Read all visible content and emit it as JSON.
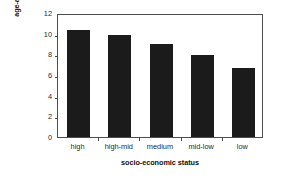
{
  "chart_data": {
    "type": "bar",
    "title": "",
    "subtitle": "",
    "xlabel": "socio-economic status",
    "ylabel": "age-adjusted incidence (per 100,000)",
    "ylabel_lines": [
      "age-adjusted incidence",
      "(per 100,000)"
    ],
    "categories": [
      "high",
      "high-mid",
      "medium",
      "mid-low",
      "low"
    ],
    "values": [
      10.4,
      9.9,
      9.0,
      7.9,
      6.7
    ],
    "series": [
      {
        "name": "age-adjusted incidence",
        "values": [
          10.4,
          9.9,
          9.0,
          7.9,
          6.7
        ]
      }
    ],
    "ylim": [
      0,
      12
    ],
    "yticks": [
      0,
      2,
      4,
      6,
      8,
      10,
      12
    ],
    "ytick_labels": [
      "0",
      "2",
      "4",
      "6",
      "8",
      "10",
      "12"
    ],
    "xlim": [
      0,
      5
    ],
    "grid": false,
    "legend": false,
    "legend_position": "none",
    "annotations": [],
    "colors": {
      "bar": "#1b1b1b",
      "frame": "#4d4d4d",
      "background": "#ffffff",
      "tick_label": "#2a2a2a",
      "axis_title": "#111111"
    }
  }
}
